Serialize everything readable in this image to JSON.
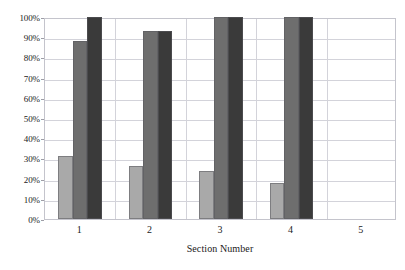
{
  "chart_data": {
    "type": "bar",
    "title": "",
    "xlabel": "Section Number",
    "ylabel": "",
    "categories": [
      "1",
      "2",
      "3",
      "4",
      "5"
    ],
    "series": [
      {
        "name": "series-1",
        "color": "#a9a9a9",
        "values": [
          31,
          26,
          24,
          18,
          null
        ]
      },
      {
        "name": "series-2",
        "color": "#6e6e6e",
        "values": [
          88,
          93,
          100,
          100,
          null
        ]
      },
      {
        "name": "series-3",
        "color": "#3a3a3a",
        "values": [
          100,
          93,
          100,
          100,
          null
        ]
      }
    ],
    "ylim": [
      0,
      100
    ],
    "ytick_labels": [
      "100%",
      "90%",
      "80%",
      "70%",
      "60%",
      "50%",
      "40%",
      "30%",
      "20%",
      "10%",
      "0%"
    ],
    "ytick_values": [
      100,
      90,
      80,
      70,
      60,
      50,
      40,
      30,
      20,
      10,
      0
    ],
    "grid": true,
    "legend": "none",
    "value_suffix": "%"
  },
  "axis": {
    "x_title": "Section Number"
  }
}
